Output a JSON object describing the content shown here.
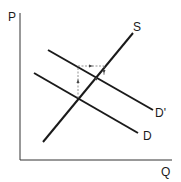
{
  "diagram": {
    "type": "supply-demand",
    "axes": {
      "y_label": "P",
      "x_label": "Q"
    },
    "curves": [
      {
        "name": "S",
        "label": "S",
        "kind": "supply",
        "from": [
          43,
          142
        ],
        "to": [
          133,
          33
        ]
      },
      {
        "name": "D'",
        "label": "D'",
        "kind": "demand-shifted",
        "from": [
          48,
          50
        ],
        "to": [
          153,
          110
        ]
      },
      {
        "name": "D",
        "label": "D",
        "kind": "demand",
        "from": [
          34,
          73
        ],
        "to": [
          138,
          133
        ]
      }
    ],
    "annotations": [
      {
        "kind": "dashed-arrow-up",
        "description": "vertical shift from original equilibrium upward"
      },
      {
        "kind": "dashed-arrow-right",
        "description": "horizontal shift along top"
      },
      {
        "kind": "dashed-arrow-down",
        "description": "down toward new equilibrium"
      }
    ],
    "colors": {
      "line": "#1a1a1a",
      "dashed": "#777777",
      "background": "#ffffff"
    }
  }
}
